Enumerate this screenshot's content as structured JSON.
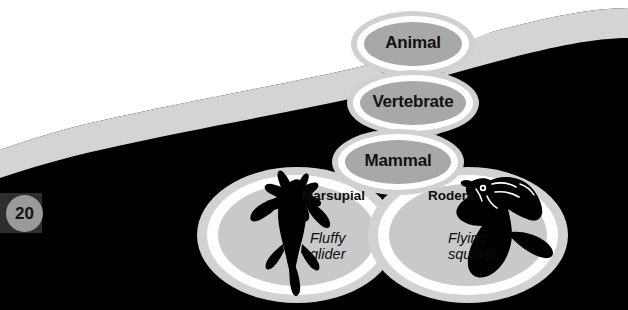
{
  "page": {
    "number": "20",
    "background_color": "#000000",
    "swoosh_color": "#d4d4d4",
    "white_color": "#ffffff"
  },
  "diagram": {
    "title_nodes": [
      {
        "id": "animal",
        "label": "Animal"
      },
      {
        "id": "vertebrate",
        "label": "Vertebrate"
      },
      {
        "id": "mammal",
        "label": "Mammal"
      }
    ],
    "arrows": [
      {
        "from": "animal",
        "to": "vertebrate"
      },
      {
        "from": "vertebrate",
        "to": "mammal"
      }
    ],
    "groups": [
      {
        "id": "marsupial",
        "category": "Marsupial",
        "species": "Fluffy\nglider",
        "species_line1": "Fluffy",
        "species_line2": "glider",
        "silhouette": "sugar-glider-silhouette"
      },
      {
        "id": "rodent",
        "category": "Rodent",
        "species": "Flying\nsquirrel",
        "species_line1": "Flying",
        "species_line2": "squirrel",
        "silhouette": "flying-squirrel-silhouette"
      }
    ],
    "colors": {
      "node_fill": "#a8a8a8",
      "node_ring": "#ffffff",
      "node_glow": "#d0d0d0",
      "arrow": "#8f8f8f",
      "circle_fill": "#c9c9c9",
      "circle_ring": "#ffffff",
      "circle_glow": "#d2d2d2",
      "silhouette": "#000000",
      "text": "#111111"
    }
  }
}
